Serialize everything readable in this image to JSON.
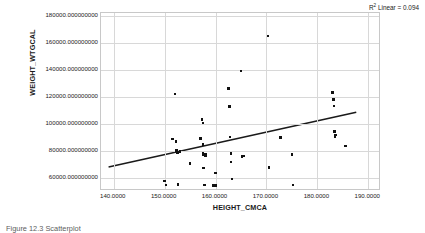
{
  "figure": {
    "rsq_prefix": "R",
    "rsq_sup": "2",
    "rsq_text": " Linear = 0.094",
    "caption": "Figure 12.3  Scatterplot"
  },
  "chart_data": {
    "type": "scatter",
    "title": "",
    "subtitle": "",
    "xlabel": "HEIGHT_CMCA",
    "ylabel": "WEIGHT_WTGCAL",
    "xlim": [
      137.5,
      192.5
    ],
    "ylim": [
      50000,
      182000
    ],
    "grid": true,
    "legend_position": "none",
    "annotations": [
      {
        "text": "R2 Linear = 0.094",
        "position": "top-right",
        "r_squared": 0.094
      }
    ],
    "xticks": [
      140.0,
      150.0,
      160.0,
      170.0,
      180.0,
      190.0
    ],
    "xticklabels": [
      "140.0000",
      "150.0000",
      "160.0000",
      "170.0000",
      "180.0000",
      "190.0000"
    ],
    "yticks": [
      60000,
      80000,
      100000,
      120000,
      140000,
      160000,
      180000
    ],
    "yticklabels": [
      "60000.000000000",
      "80000.000000000",
      "100000.000000000",
      "120000.000000000",
      "140000.000000000",
      "160000.000000000",
      "180000.000000000"
    ],
    "marker": {
      "shape": "square",
      "color": "#111111",
      "size": 2.6
    },
    "fit_line": {
      "type": "linear",
      "color": "#1a1a1a",
      "width": 1.6,
      "x_start": 139.0,
      "y_start": 66500,
      "x_end": 188.0,
      "y_end": 107500,
      "slope": 836.7,
      "intercept": -49840.0
    },
    "x": [
      150.0,
      150.3,
      151.5,
      152.0,
      152.2,
      152.3,
      152.5,
      152.5,
      152.6,
      153.0,
      155.0,
      157.0,
      157.3,
      157.5,
      157.5,
      157.5,
      157.5,
      157.5,
      157.5,
      157.6,
      157.8,
      158.0,
      158.0,
      159.5,
      160.0,
      160.0,
      162.5,
      162.7,
      162.8,
      163.0,
      163.0,
      163.2,
      165.0,
      165.2,
      165.5,
      170.3,
      170.5,
      172.8,
      175.0,
      175.2,
      183.0,
      183.2,
      183.3,
      183.4,
      183.5,
      183.6,
      185.5
    ],
    "y": [
      57500,
      54500,
      88500,
      122000,
      86500,
      80000,
      79000,
      78500,
      55000,
      79500,
      70500,
      89000,
      103000,
      100500,
      85000,
      84000,
      78000,
      77500,
      77000,
      67000,
      54500,
      77500,
      76500,
      54000,
      63500,
      54000,
      126000,
      112500,
      90000,
      78000,
      71500,
      59000,
      139000,
      75500,
      76000,
      165000,
      67500,
      89500,
      77000,
      54500,
      123000,
      118000,
      113000,
      94000,
      90500,
      91500,
      83500
    ]
  }
}
